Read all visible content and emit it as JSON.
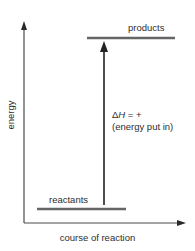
{
  "diagram": {
    "type": "energy-level-diagram",
    "title": "",
    "axes": {
      "x_label": "course of reaction",
      "y_label": "energy"
    },
    "levels": {
      "products": {
        "label": "products"
      },
      "reactants": {
        "label": "reactants"
      }
    },
    "enthalpy_change": {
      "delta_symbol": "Δ",
      "variable": "H",
      "relation": " = +",
      "note": "(energy put in)"
    },
    "colors": {
      "axis": "#4a4a4a",
      "level_line": "#666666",
      "arrow": "#3a3a3a",
      "text": "#2e2e2e",
      "background": "#ffffff"
    }
  }
}
